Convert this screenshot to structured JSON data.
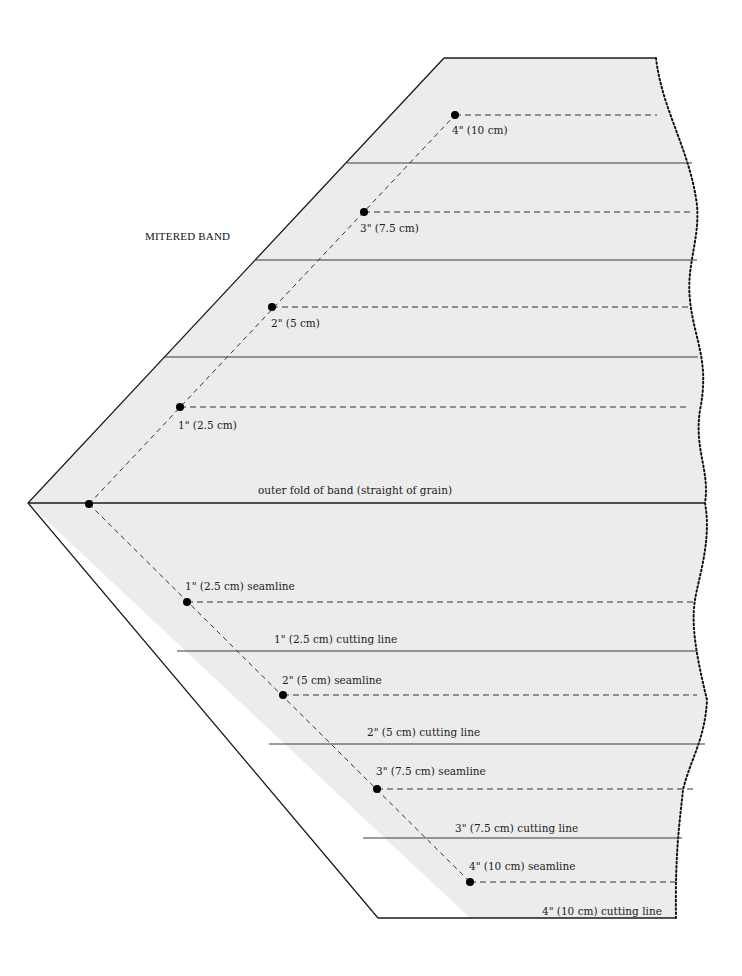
{
  "title": "MITERED BAND",
  "colors": {
    "fabric": "#ececec",
    "outline": "#1a1a1a",
    "cutting_line": "#3a3a3a",
    "seam_dash": "#333333",
    "dot": "#000000",
    "text": "#222222"
  },
  "fold": {
    "label": "outer fold of band (straight of grain)",
    "point": [
      89,
      504
    ]
  },
  "upper_half": {
    "marks": [
      {
        "label": "1\" (2.5 cm)",
        "dot": [
          180,
          407
        ]
      },
      {
        "label": "2\" (5 cm)",
        "dot": [
          272,
          307
        ]
      },
      {
        "label": "3\" (7.5 cm)",
        "dot": [
          364,
          212
        ]
      },
      {
        "label": "4\" (10 cm)",
        "dot": [
          455,
          115
        ]
      }
    ]
  },
  "lower_half": {
    "seamlines": [
      {
        "label": "1\" (2.5 cm) seamline",
        "dot": [
          187,
          602
        ]
      },
      {
        "label": "2\" (5 cm) seamline",
        "dot": [
          283,
          695
        ]
      },
      {
        "label": "3\" (7.5 cm) seamline",
        "dot": [
          377,
          789
        ]
      },
      {
        "label": "4\" (10 cm) seamline",
        "dot": [
          470,
          882
        ]
      }
    ],
    "cutting_lines": [
      {
        "label": "1\" (2.5 cm) cutting line"
      },
      {
        "label": "2\" (5 cm) cutting line"
      },
      {
        "label": "3\" (7.5 cm) cutting line"
      },
      {
        "label": "4\" (10 cm) cutting line"
      }
    ]
  }
}
